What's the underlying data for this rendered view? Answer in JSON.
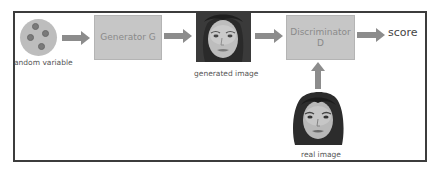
{
  "diagram": {
    "nodes": {
      "random_variable": {
        "label": "andom variable",
        "icon": "noise-circle-icon"
      },
      "generator": {
        "label": "Generator G"
      },
      "generated_image": {
        "label": "generated image"
      },
      "discriminator": {
        "line1": "Discriminator",
        "line2": "D"
      },
      "score": {
        "label": "score"
      },
      "real_image": {
        "label": "real image"
      }
    },
    "edges": [
      {
        "from": "random_variable",
        "to": "generator"
      },
      {
        "from": "generator",
        "to": "generated_image"
      },
      {
        "from": "generated_image",
        "to": "discriminator"
      },
      {
        "from": "discriminator",
        "to": "score"
      },
      {
        "from": "real_image",
        "to": "discriminator"
      }
    ],
    "colors": {
      "box_fill": "#c6c6c6",
      "arrow": "#8c8c8c",
      "frame": "#3c3c3c",
      "circle_fill": "#bdbdbd",
      "dot_fill": "#7a7a7a"
    }
  }
}
